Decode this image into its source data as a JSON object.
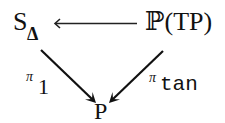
{
  "diagram": {
    "type": "commutative-diagram",
    "nodes": {
      "top_left": {
        "main": "S",
        "subscript": "Δ"
      },
      "top_right": {
        "text": "ℙ(TP)"
      },
      "bottom": {
        "text": "P"
      }
    },
    "arrows": [
      {
        "from": "top_right",
        "to": "top_left",
        "label": ""
      },
      {
        "from": "top_left",
        "to": "bottom",
        "label": {
          "symbol": "π",
          "subscript": "1"
        }
      },
      {
        "from": "top_right",
        "to": "bottom",
        "label": {
          "symbol": "π",
          "subscript": "tan"
        }
      }
    ],
    "colors": {
      "ink": "#111111",
      "background": "#ffffff"
    }
  }
}
